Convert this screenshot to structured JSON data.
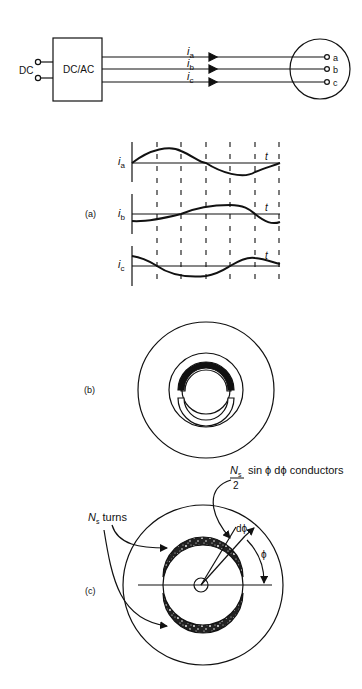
{
  "figure": {
    "top": {
      "dc_label": "DC",
      "converter_label": "DC/AC",
      "currents": [
        {
          "sym": "i",
          "sub": "a"
        },
        {
          "sym": "i",
          "sub": "b"
        },
        {
          "sym": "i",
          "sub": "c"
        }
      ],
      "terminals": [
        "a",
        "b",
        "c"
      ]
    },
    "panel_a": {
      "label": "(a)",
      "waveforms": [
        {
          "sym": "i",
          "sub": "a",
          "axis": "t"
        },
        {
          "sym": "i",
          "sub": "b",
          "axis": "t"
        },
        {
          "sym": "i",
          "sub": "c",
          "axis": "t"
        }
      ]
    },
    "panel_b": {
      "label": "(b)"
    },
    "panel_c": {
      "label": "(c)",
      "turns_sym": "N",
      "turns_sub": "s",
      "turns_text": " turns",
      "cond_sym": "N",
      "cond_sub": "s",
      "cond_den": "2",
      "cond_text": "sin ϕ dϕ conductors",
      "dphi": "dϕ",
      "phi": "ϕ"
    }
  }
}
